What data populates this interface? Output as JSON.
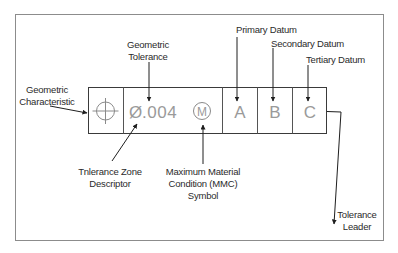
{
  "diagram": {
    "colors": {
      "border": "#8c8c8c",
      "frame": "#3a3a3a",
      "arrow": "#1e1e1e",
      "cell_text": "#9a9a9a",
      "label_text": "#2a2a2a"
    },
    "frame": {
      "cells": [
        {
          "id": "geometric-characteristic",
          "symbol": "position-symbol",
          "text": ""
        },
        {
          "id": "tolerance",
          "diameter_symbol": "Ø",
          "value": ".004",
          "modifier": "M"
        },
        {
          "id": "primary-datum",
          "text": "A"
        },
        {
          "id": "secondary-datum",
          "text": "B"
        },
        {
          "id": "tertiary-datum",
          "text": "C"
        }
      ]
    },
    "labels": {
      "geometric_characteristic": [
        "Geometric",
        "Characteristic"
      ],
      "geometric_tolerance": [
        "Geometric",
        "Tolerance"
      ],
      "primary_datum": "Primary Datum",
      "secondary_datum": "Secondary Datum",
      "tertiary_datum": "Tertiary Datum",
      "tolerance_zone_descriptor": [
        "Tnlerance Zone",
        "Descriptor"
      ],
      "mmc_symbol": [
        "Maximum Material",
        "Condition (MMC)",
        "Symbol"
      ],
      "tolerance_leader": [
        "Tolerance",
        "Leader"
      ]
    }
  }
}
